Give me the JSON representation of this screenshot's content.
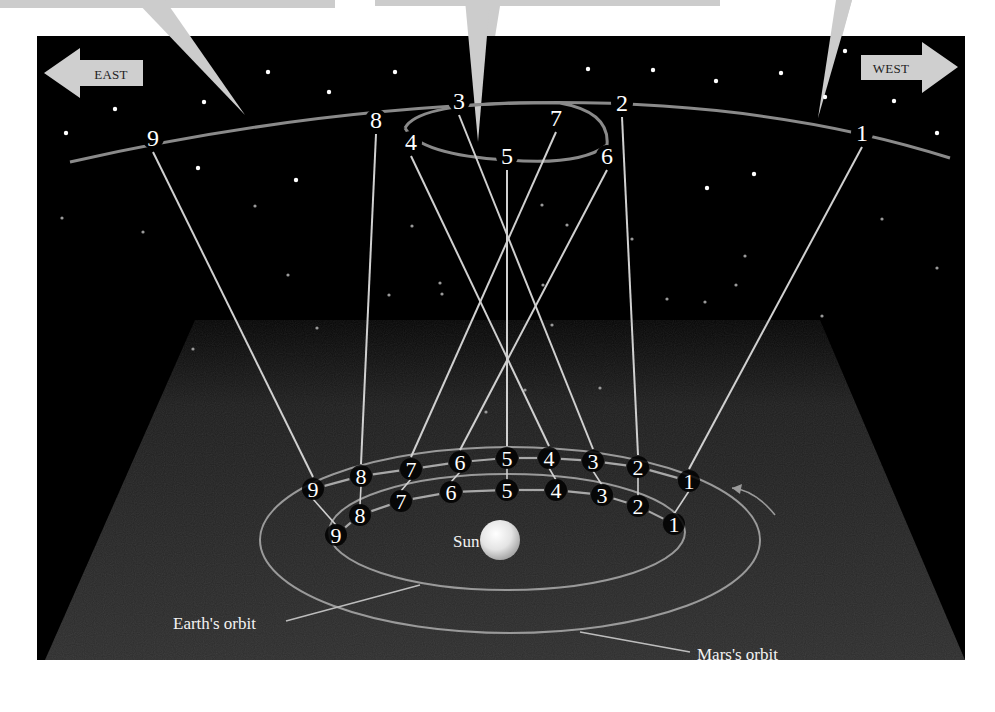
{
  "figure": {
    "colors": {
      "sky": "#000000",
      "plane": "#2a2a2a",
      "line": "#cfcfcf",
      "ecliptic": "#8a8a8a",
      "callout": "#cccccc",
      "arrow": "#cfcfcf",
      "page": "#ffffff"
    }
  },
  "directions": {
    "east": "EAST",
    "west": "WEST"
  },
  "labels": {
    "sun": "Sun",
    "earth_orbit": "Earth's orbit",
    "mars_orbit": "Mars's orbit"
  },
  "sky_positions": [
    {
      "n": "1",
      "x": 862,
      "y": 133
    },
    {
      "n": "2",
      "x": 622,
      "y": 103
    },
    {
      "n": "3",
      "x": 459,
      "y": 101
    },
    {
      "n": "4",
      "x": 411,
      "y": 142
    },
    {
      "n": "5",
      "x": 507,
      "y": 156
    },
    {
      "n": "6",
      "x": 607,
      "y": 156
    },
    {
      "n": "7",
      "x": 556,
      "y": 118
    },
    {
      "n": "8",
      "x": 376,
      "y": 120
    },
    {
      "n": "9",
      "x": 153,
      "y": 138
    }
  ],
  "mars_positions": [
    {
      "n": "1",
      "x": 689,
      "y": 481
    },
    {
      "n": "2",
      "x": 638,
      "y": 467
    },
    {
      "n": "3",
      "x": 593,
      "y": 461
    },
    {
      "n": "4",
      "x": 549,
      "y": 458
    },
    {
      "n": "5",
      "x": 507,
      "y": 458
    },
    {
      "n": "6",
      "x": 460,
      "y": 462
    },
    {
      "n": "7",
      "x": 411,
      "y": 469
    },
    {
      "n": "8",
      "x": 361,
      "y": 476
    },
    {
      "n": "9",
      "x": 313,
      "y": 489
    }
  ],
  "earth_positions": [
    {
      "n": "1",
      "x": 674,
      "y": 524
    },
    {
      "n": "2",
      "x": 638,
      "y": 506
    },
    {
      "n": "3",
      "x": 602,
      "y": 495
    },
    {
      "n": "4",
      "x": 556,
      "y": 490
    },
    {
      "n": "5",
      "x": 507,
      "y": 490
    },
    {
      "n": "6",
      "x": 451,
      "y": 492
    },
    {
      "n": "7",
      "x": 401,
      "y": 501
    },
    {
      "n": "8",
      "x": 360,
      "y": 515
    },
    {
      "n": "9",
      "x": 336,
      "y": 535
    }
  ],
  "stars": [
    [
      268,
      72
    ],
    [
      329,
      92
    ],
    [
      395,
      72
    ],
    [
      204,
      102
    ],
    [
      115,
      109
    ],
    [
      66,
      133
    ],
    [
      198,
      168
    ],
    [
      296,
      180
    ],
    [
      588,
      69
    ],
    [
      653,
      70
    ],
    [
      716,
      81
    ],
    [
      781,
      73
    ],
    [
      845,
      51
    ],
    [
      825,
      97
    ],
    [
      894,
      101
    ],
    [
      937,
      133
    ],
    [
      754,
      174
    ],
    [
      707,
      188
    ],
    [
      882,
      219
    ],
    [
      937,
      268
    ],
    [
      143,
      232
    ],
    [
      62,
      218
    ],
    [
      255,
      206
    ],
    [
      288,
      275
    ],
    [
      317,
      328
    ],
    [
      193,
      349
    ],
    [
      412,
      226
    ],
    [
      440,
      283
    ],
    [
      442,
      294
    ],
    [
      389,
      295
    ],
    [
      542,
      205
    ],
    [
      543,
      285
    ],
    [
      567,
      225
    ],
    [
      552,
      325
    ],
    [
      632,
      239
    ],
    [
      745,
      256
    ],
    [
      736,
      285
    ],
    [
      705,
      302
    ],
    [
      667,
      299
    ],
    [
      822,
      316
    ],
    [
      600,
      388
    ],
    [
      486,
      412
    ],
    [
      525,
      390
    ]
  ]
}
